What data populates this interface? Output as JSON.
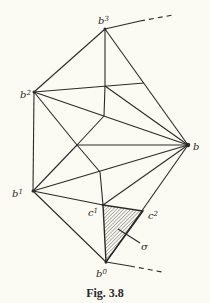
{
  "figure": {
    "caption": "Fig. 3.8",
    "vertices": {
      "b": {
        "label": "b",
        "x": 188,
        "y": 145
      },
      "b0": {
        "label": "b",
        "sup": "0",
        "x": 106,
        "y": 262
      },
      "b1": {
        "label": "b",
        "sup": "1",
        "x": 33,
        "y": 191
      },
      "b2": {
        "label": "b",
        "sup": "2",
        "x": 34,
        "y": 92
      },
      "b3": {
        "label": "b",
        "sup": "3",
        "x": 105,
        "y": 29
      },
      "c1": {
        "label": "c",
        "sup": "1",
        "x": 103,
        "y": 205
      },
      "c2": {
        "label": "c",
        "sup": "2",
        "x": 143,
        "y": 211
      }
    },
    "simplex_label": "σ",
    "colors": {
      "line": "#2a2a2a",
      "background": "#fbfbf3",
      "hatch": "#555555"
    }
  }
}
